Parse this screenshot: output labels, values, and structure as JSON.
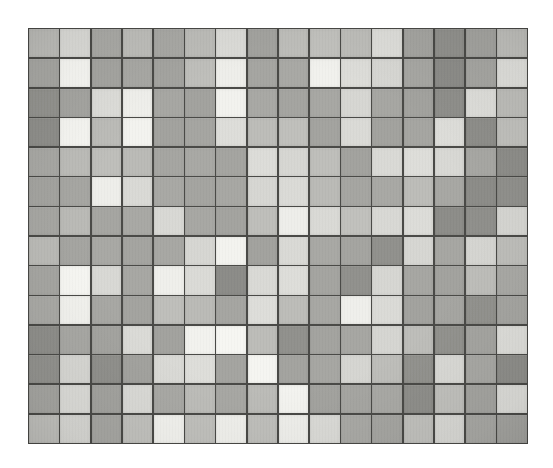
{
  "artwork": {
    "title": "Grid Composition",
    "medium_note": "grayscale photographic reproduction of a painted modular grid",
    "background_color": "#ffffff",
    "plate": {
      "x": 28,
      "y": 28,
      "width": 500,
      "height": 416,
      "grid_line_color": "#4a4a47",
      "grid_line_width_px": 1.6
    }
  },
  "chart_data": {
    "type": "heatmap",
    "subtitle": "",
    "xlabel": "",
    "ylabel": "",
    "columns": 16,
    "rows": 14,
    "grid": true,
    "legend_position": "none",
    "value_scale": "gray level index 0 (darkest) to 4 (lightest)",
    "tone_palette": {
      "0": "#8e8e8a",
      "1": "#a5a5a1",
      "2": "#bdbdb9",
      "3": "#d9d9d5",
      "4": "#f2f2ee"
    },
    "tone_names": {
      "0": "dark-gray",
      "1": "mid-dark-gray",
      "2": "mid-gray",
      "3": "light-gray",
      "4": "near-white"
    },
    "x_tick_labels": [
      "1",
      "2",
      "3",
      "4",
      "5",
      "6",
      "7",
      "8",
      "9",
      "10",
      "11",
      "12",
      "13",
      "14",
      "15",
      "16"
    ],
    "y_tick_labels": [
      "1",
      "2",
      "3",
      "4",
      "5",
      "6",
      "7",
      "8",
      "9",
      "10",
      "11",
      "12",
      "13",
      "14"
    ],
    "values": [
      [
        2,
        3,
        1,
        2,
        1,
        2,
        3,
        1,
        2,
        2,
        2,
        3,
        1,
        0,
        1,
        2
      ],
      [
        1,
        4,
        1,
        1,
        1,
        2,
        4,
        1,
        1,
        4,
        3,
        3,
        1,
        0,
        1,
        3
      ],
      [
        0,
        1,
        3,
        4,
        1,
        1,
        4,
        1,
        1,
        1,
        3,
        1,
        1,
        0,
        3,
        2
      ],
      [
        0,
        4,
        2,
        4,
        1,
        1,
        3,
        2,
        2,
        1,
        3,
        1,
        1,
        3,
        0,
        2
      ],
      [
        1,
        2,
        2,
        2,
        1,
        1,
        1,
        3,
        3,
        2,
        1,
        3,
        3,
        3,
        1,
        0
      ],
      [
        1,
        1,
        4,
        3,
        1,
        1,
        1,
        3,
        3,
        2,
        1,
        1,
        2,
        1,
        0,
        0
      ],
      [
        1,
        2,
        1,
        1,
        3,
        1,
        1,
        2,
        4,
        3,
        2,
        3,
        3,
        0,
        0,
        3
      ],
      [
        2,
        1,
        1,
        1,
        1,
        3,
        4,
        1,
        3,
        1,
        1,
        0,
        3,
        1,
        3,
        2
      ],
      [
        1,
        4,
        3,
        1,
        4,
        3,
        0,
        3,
        3,
        1,
        0,
        3,
        1,
        1,
        2,
        1
      ],
      [
        1,
        4,
        1,
        1,
        2,
        2,
        1,
        3,
        2,
        1,
        4,
        3,
        1,
        1,
        0,
        1
      ],
      [
        0,
        1,
        1,
        3,
        1,
        4,
        4,
        2,
        0,
        1,
        1,
        3,
        2,
        0,
        1,
        3
      ],
      [
        0,
        3,
        0,
        1,
        3,
        3,
        1,
        4,
        1,
        1,
        3,
        2,
        0,
        3,
        1,
        0
      ],
      [
        1,
        3,
        1,
        3,
        1,
        2,
        1,
        2,
        4,
        1,
        1,
        1,
        0,
        2,
        1,
        3
      ],
      [
        2,
        3,
        1,
        2,
        4,
        2,
        4,
        2,
        4,
        3,
        1,
        1,
        2,
        3,
        1,
        1
      ]
    ]
  }
}
